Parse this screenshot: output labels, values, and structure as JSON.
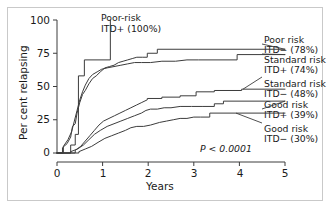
{
  "figure": {
    "background_color": "#ffffff",
    "frame_color": "#c9c9c9",
    "line_color": "#3c3c3c"
  },
  "chart_data": {
    "type": "line",
    "title": "",
    "xlabel": "Years",
    "ylabel": "Per cent relapsing",
    "xlim": [
      0,
      5
    ],
    "ylim": [
      0,
      100
    ],
    "xticks": [
      0,
      1,
      2,
      3,
      4,
      5
    ],
    "yticks": [
      0,
      25,
      50,
      75,
      100
    ],
    "xticklabels": [
      "0",
      "1",
      "2",
      "3",
      "4",
      "5"
    ],
    "yticklabels": [
      "0",
      "25",
      "50",
      "75",
      "100"
    ],
    "grid": false,
    "legend_position": "right-outside-labels",
    "annotations": [
      {
        "name": "poor-risk-itd-pos-callout",
        "text_lines": [
          "Poor-risk",
          "ITD+ (100%)"
        ],
        "x": 1.2,
        "y": 100
      },
      {
        "name": "p-value",
        "text": "P < 0.0001",
        "x": 3.3,
        "y": 12
      }
    ],
    "series": [
      {
        "name": "Poor risk ITD+ (100%)",
        "label_lines": [
          "Poor-risk",
          "ITD+ (100%)"
        ],
        "final_value": 100,
        "points": [
          [
            0,
            0
          ],
          [
            0.3,
            0
          ],
          [
            0.3,
            6
          ],
          [
            0.4,
            6
          ],
          [
            0.4,
            14
          ],
          [
            0.47,
            14
          ],
          [
            0.47,
            58
          ],
          [
            0.6,
            58
          ],
          [
            0.6,
            70
          ],
          [
            1.17,
            70
          ],
          [
            1.17,
            100
          ]
        ]
      },
      {
        "name": "Poor risk ITD- (78%)",
        "label_lines": [
          "Poor risk",
          "ITD− (78%)"
        ],
        "final_value": 78,
        "points": [
          [
            0,
            0
          ],
          [
            0.12,
            0
          ],
          [
            0.12,
            4
          ],
          [
            0.22,
            7
          ],
          [
            0.3,
            12
          ],
          [
            0.34,
            20
          ],
          [
            0.4,
            22
          ],
          [
            0.44,
            30
          ],
          [
            0.5,
            38
          ],
          [
            0.56,
            44
          ],
          [
            0.62,
            47
          ],
          [
            0.7,
            52
          ],
          [
            0.78,
            56
          ],
          [
            0.86,
            58
          ],
          [
            0.95,
            61
          ],
          [
            1.05,
            64
          ],
          [
            1.15,
            65
          ],
          [
            1.25,
            66
          ],
          [
            1.35,
            68
          ],
          [
            1.45,
            69
          ],
          [
            1.55,
            70
          ],
          [
            1.65,
            71
          ],
          [
            1.75,
            72
          ],
          [
            1.88,
            72
          ],
          [
            1.98,
            72
          ],
          [
            1.98,
            75
          ],
          [
            2.2,
            75
          ],
          [
            2.2,
            78
          ],
          [
            5.0,
            78
          ]
        ]
      },
      {
        "name": "Standard risk ITD+ (74%)",
        "label_lines": [
          "Standard risk",
          "ITD+ (74%)"
        ],
        "final_value": 74,
        "points": [
          [
            0,
            0
          ],
          [
            0.14,
            0
          ],
          [
            0.14,
            5
          ],
          [
            0.24,
            10
          ],
          [
            0.32,
            16
          ],
          [
            0.38,
            24
          ],
          [
            0.44,
            32
          ],
          [
            0.5,
            40
          ],
          [
            0.56,
            46
          ],
          [
            0.62,
            51
          ],
          [
            0.7,
            56
          ],
          [
            0.78,
            59
          ],
          [
            0.88,
            61
          ],
          [
            0.98,
            63
          ],
          [
            1.1,
            64
          ],
          [
            1.25,
            65
          ],
          [
            1.4,
            66
          ],
          [
            1.55,
            67
          ],
          [
            1.7,
            68
          ],
          [
            1.85,
            68
          ],
          [
            2.05,
            68
          ],
          [
            2.3,
            69
          ],
          [
            2.6,
            69
          ],
          [
            2.85,
            70
          ],
          [
            3.1,
            70
          ],
          [
            3.95,
            70
          ],
          [
            3.95,
            74
          ],
          [
            5.0,
            74
          ]
        ]
      },
      {
        "name": "Standard risk ITD- (48%)",
        "label_lines": [
          "Standard risk",
          "ITD− (48%)"
        ],
        "final_value": 48,
        "points": [
          [
            0,
            0
          ],
          [
            0.4,
            0
          ],
          [
            0.4,
            2
          ],
          [
            0.52,
            5
          ],
          [
            0.62,
            9
          ],
          [
            0.72,
            13
          ],
          [
            0.82,
            17
          ],
          [
            0.92,
            21
          ],
          [
            1.02,
            24
          ],
          [
            1.14,
            26
          ],
          [
            1.26,
            28
          ],
          [
            1.38,
            30
          ],
          [
            1.5,
            32
          ],
          [
            1.62,
            34
          ],
          [
            1.74,
            36
          ],
          [
            1.86,
            38
          ],
          [
            1.98,
            40
          ],
          [
            1.98,
            41
          ],
          [
            2.3,
            41
          ],
          [
            2.3,
            42
          ],
          [
            2.7,
            42
          ],
          [
            2.7,
            43
          ],
          [
            3.05,
            43
          ],
          [
            3.05,
            46
          ],
          [
            3.45,
            46
          ],
          [
            3.45,
            47
          ],
          [
            4.05,
            47
          ],
          [
            4.05,
            48
          ],
          [
            5.0,
            48
          ]
        ]
      },
      {
        "name": "Good risk ITD+ (39%)",
        "label_lines": [
          "Good risk",
          "ITD+ (39%)"
        ],
        "final_value": 39,
        "points": [
          [
            0,
            0
          ],
          [
            0.3,
            0
          ],
          [
            0.3,
            1
          ],
          [
            0.45,
            3
          ],
          [
            0.58,
            6
          ],
          [
            0.7,
            10
          ],
          [
            0.82,
            14
          ],
          [
            0.95,
            17
          ],
          [
            1.1,
            20
          ],
          [
            1.25,
            22
          ],
          [
            1.4,
            24
          ],
          [
            1.55,
            26
          ],
          [
            1.7,
            28
          ],
          [
            1.85,
            30
          ],
          [
            1.95,
            32
          ],
          [
            2.05,
            33
          ],
          [
            2.2,
            33
          ],
          [
            2.35,
            34
          ],
          [
            2.5,
            34
          ],
          [
            2.7,
            35
          ],
          [
            2.95,
            35
          ],
          [
            3.2,
            35
          ],
          [
            3.45,
            35
          ],
          [
            3.45,
            37
          ],
          [
            3.65,
            37
          ],
          [
            3.65,
            39
          ],
          [
            5.0,
            39
          ]
        ]
      },
      {
        "name": "Good risk ITD- (30%)",
        "label_lines": [
          "Good risk",
          "ITD− (30%)"
        ],
        "final_value": 30,
        "points": [
          [
            0,
            0
          ],
          [
            0.48,
            0
          ],
          [
            0.48,
            1
          ],
          [
            0.62,
            3
          ],
          [
            0.76,
            5
          ],
          [
            0.9,
            8
          ],
          [
            1.05,
            11
          ],
          [
            1.2,
            13
          ],
          [
            1.35,
            15
          ],
          [
            1.5,
            17
          ],
          [
            1.62,
            19
          ],
          [
            1.75,
            20
          ],
          [
            1.9,
            20
          ],
          [
            2.05,
            21
          ],
          [
            2.15,
            22
          ],
          [
            2.25,
            23
          ],
          [
            2.4,
            24
          ],
          [
            2.55,
            25
          ],
          [
            2.7,
            26
          ],
          [
            2.85,
            26
          ],
          [
            3.0,
            27
          ],
          [
            3.15,
            27
          ],
          [
            3.35,
            27
          ],
          [
            3.35,
            30
          ],
          [
            5.0,
            30
          ]
        ]
      }
    ]
  },
  "legend": {
    "entries": [
      {
        "name": "legend-poor-risk-itd-neg",
        "line1": "Poor risk",
        "line2": "ITD− (78%)"
      },
      {
        "name": "legend-standard-risk-itd-pos",
        "line1": "Standard risk",
        "line2": "ITD+ (74%)"
      },
      {
        "name": "legend-standard-risk-itd-neg",
        "line1": "Standard risk",
        "line2": "ITD− (48%)"
      },
      {
        "name": "legend-good-risk-itd-pos",
        "line1": "Good risk",
        "line2": "ITD+ (39%)"
      },
      {
        "name": "legend-good-risk-itd-neg",
        "line1": "Good risk",
        "line2": "ITD− (30%)"
      }
    ]
  },
  "callout": {
    "line1": "Poor-risk",
    "line2": "ITD+ (100%)"
  },
  "pvalue": {
    "text": "P < 0.0001"
  },
  "axes": {
    "x_title": "Years",
    "y_title": "Per cent relapsing"
  }
}
